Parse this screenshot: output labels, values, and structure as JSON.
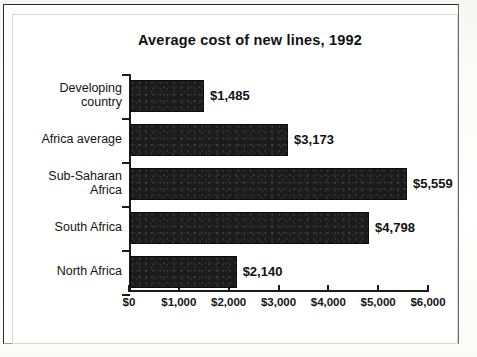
{
  "chart_data": {
    "type": "bar",
    "orientation": "horizontal",
    "title": "Average cost of new lines, 1992",
    "xlabel": "",
    "ylabel": "",
    "categories": [
      "Developing\ncountry",
      "Africa average",
      "Sub-Saharan\nAfrica",
      "South Africa",
      "North Africa"
    ],
    "values": [
      1485,
      3173,
      5559,
      4798,
      2140
    ],
    "value_labels": [
      "$1,485",
      "$3,173",
      "$5,559",
      "$4,798",
      "$2,140"
    ],
    "xlim": [
      0,
      6000
    ],
    "xticks": [
      0,
      1000,
      2000,
      3000,
      4000,
      5000,
      6000
    ],
    "xtick_labels": [
      "$0",
      "$1,000",
      "$2,000",
      "$3,000",
      "$4,000",
      "$5,000",
      "$6,000"
    ],
    "grid": false,
    "legend": null,
    "bar_color": "#1b1b1b",
    "axis_color": "#1a1a1a",
    "text_color": "#141414"
  }
}
